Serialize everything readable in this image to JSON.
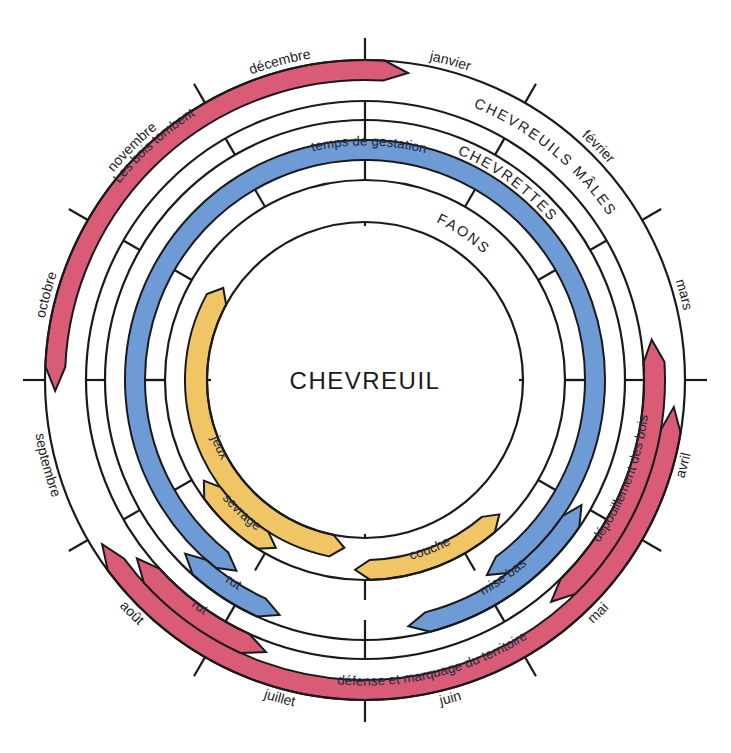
{
  "title": "CHEVREUIL",
  "colors": {
    "male": "#d95b75",
    "female": "#6e9bd6",
    "fawn": "#efc565",
    "line": "#1a1a1a",
    "background": "#ffffff"
  },
  "geometry": {
    "center": [
      365,
      380
    ],
    "radii": {
      "outer": 320,
      "male_mid": 300,
      "male_inner": 279,
      "female_outer": 260,
      "gest_outer": 240,
      "gest_inner": 220,
      "female_inner": 200,
      "fawn_mid": 180,
      "inner": 158
    }
  },
  "months": [
    {
      "label": "janvier",
      "angle": 15
    },
    {
      "label": "février",
      "angle": 45
    },
    {
      "label": "mars",
      "angle": 75
    },
    {
      "label": "avril",
      "angle": 105
    },
    {
      "label": "mai",
      "angle": 135
    },
    {
      "label": "juin",
      "angle": 165
    },
    {
      "label": "juillet",
      "angle": 195
    },
    {
      "label": "août",
      "angle": 225
    },
    {
      "label": "septembre",
      "angle": 255
    },
    {
      "label": "octobre",
      "angle": 285
    },
    {
      "label": "novembre",
      "angle": 315
    },
    {
      "label": "décembre",
      "angle": 345
    }
  ],
  "rings": [
    {
      "label": "CHEVREUILS MÂLES",
      "group": "male"
    },
    {
      "label": "CHEVRETTES",
      "group": "female"
    },
    {
      "label": "FAONS",
      "group": "fawn"
    }
  ],
  "bands": [
    {
      "label": "Les bois tombent",
      "group": "male",
      "r1": 300,
      "r2": 320,
      "from": 268,
      "to": 368
    },
    {
      "label": "défense et marquage du territoire",
      "group": "male",
      "r1": 300,
      "r2": 320,
      "from": 95,
      "to": 238
    },
    {
      "label": "dépouillement des bois",
      "group": "male",
      "r1": 279,
      "r2": 300,
      "from": 82,
      "to": 140
    },
    {
      "label": "rut",
      "group": "male",
      "r1": 279,
      "r2": 300,
      "from": 200,
      "to": 232
    },
    {
      "label": "temps de gestation",
      "group": "female",
      "r1": 220,
      "r2": 240,
      "from": -146,
      "to": 148
    },
    {
      "label": "mise bas",
      "group": "female",
      "r1": 240,
      "r2": 260,
      "from": 120,
      "to": 170
    },
    {
      "label": "rut",
      "group": "female",
      "r1": 240,
      "r2": 260,
      "from": 200,
      "to": 226
    },
    {
      "label": "jeux",
      "group": "fawn",
      "r1": 158,
      "r2": 180,
      "from": 187,
      "to": 303
    },
    {
      "label": "sevrage",
      "group": "fawn",
      "r1": 180,
      "r2": 200,
      "from": 208,
      "to": 238
    },
    {
      "label": "couche",
      "group": "fawn",
      "r1": 180,
      "r2": 200,
      "from": 135,
      "to": 183
    }
  ]
}
